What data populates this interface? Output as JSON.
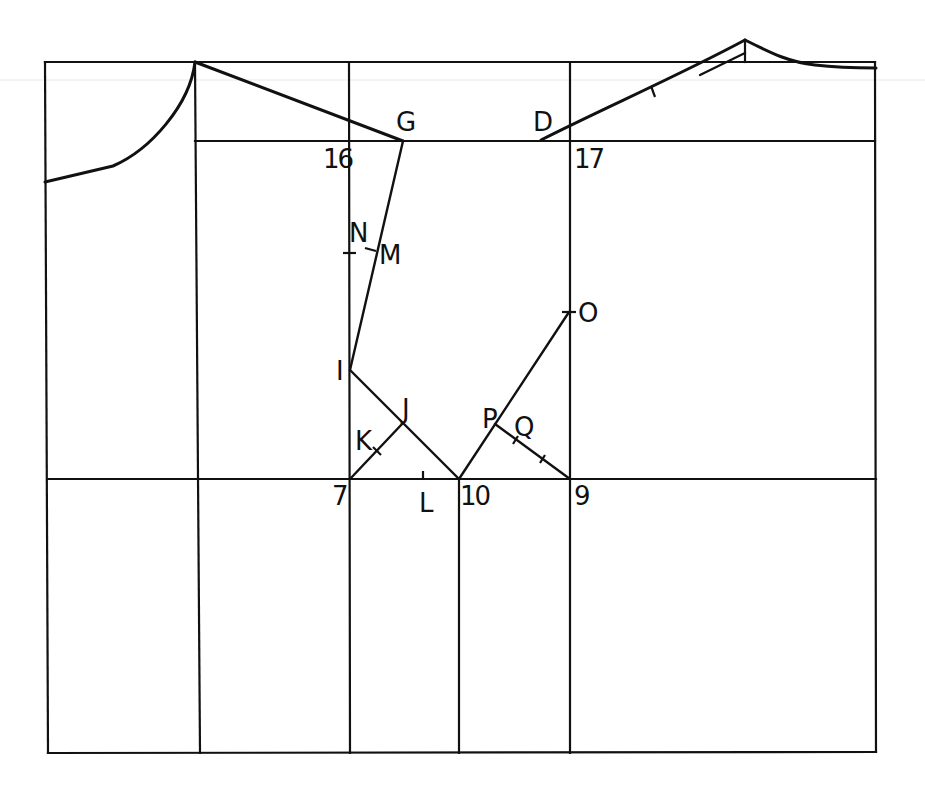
{
  "diagram": {
    "type": "pattern-drafting",
    "stroke_color": "#111111",
    "background": "#ffffff",
    "labels": {
      "G": "G",
      "D": "D",
      "p16": "16",
      "p17": "17",
      "N": "N",
      "M": "M",
      "O": "O",
      "I": "I",
      "J": "J",
      "K": "K",
      "P": "P",
      "Q": "Q",
      "p7": "7",
      "L": "L",
      "p10": "10",
      "p9": "9"
    }
  }
}
